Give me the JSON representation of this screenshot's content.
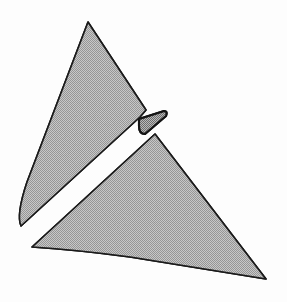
{
  "figure": {
    "background_color": "#fdfdfd",
    "outline_color": "#1a1a1a",
    "fill_description": "halftone dither, approximately 50 percent gray",
    "fill_tone_light": "#cfcfcf",
    "fill_tone_dark": "#565656",
    "fill_mean_color": "#8c8c8c",
    "canvas": {
      "width": 287,
      "height": 302
    },
    "shapes": [
      {
        "id": "upper-triangle",
        "name": "upper-left-shaded-triangle",
        "filled": true,
        "fill": "halftone",
        "vertices": [
          [
            88,
            22
          ],
          [
            145,
            109
          ],
          [
            20,
            226
          ]
        ],
        "path": "M 88 22 L 146 110 L 140 117 L 21 226 Q 16 215 27 182 L 88 22 Z"
      },
      {
        "id": "lower-triangle",
        "name": "lower-right-shaded-triangle",
        "filled": true,
        "fill": "halftone",
        "vertices": [
          [
            155,
            134
          ],
          [
            265,
            278
          ],
          [
            32,
            247
          ]
        ],
        "path": "M 155 134 L 266 279 Q 215 271 130 257 Q 78 250 32 247 L 155 134 Z"
      },
      {
        "id": "connector-tab",
        "name": "small-triangular-connector-tab",
        "filled": true,
        "fill": "halftone",
        "vertices": [
          [
            138,
            120
          ],
          [
            166,
            113
          ],
          [
            143,
            133
          ]
        ],
        "path": "M 139 119 L 164 111 Q 168 111 166 116 L 145 134 Q 139 134 139 126 Z"
      }
    ],
    "gap": {
      "name": "white-separation-band",
      "description": "white diagonal gap separating the two shaded triangles"
    }
  }
}
